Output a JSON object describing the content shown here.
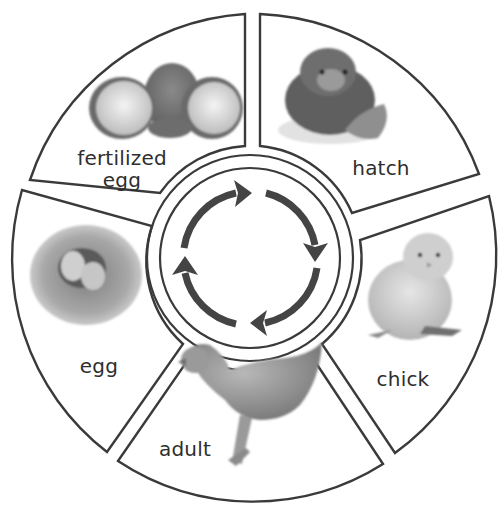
{
  "diagram": {
    "type": "life-cycle",
    "stages": [
      {
        "id": "fertilized-egg",
        "label_line1": "fertilized",
        "label_line2": "egg",
        "image": "cracked-eggshell-photo"
      },
      {
        "id": "hatch",
        "label": "hatch",
        "image": "hatching-chick-photo"
      },
      {
        "id": "chick",
        "label": "chick",
        "image": "chick-photo"
      },
      {
        "id": "adult",
        "label": "adult",
        "image": "hen-photo"
      },
      {
        "id": "egg",
        "label": "egg",
        "image": "nest-with-eggs-photo"
      }
    ],
    "center": {
      "icon": "clockwise-cycle-arrows-icon",
      "arrow_count": 4
    },
    "colors": {
      "outline": "#3a3a3a",
      "arrow": "#444444",
      "text": "#2e2e2e",
      "background": "#ffffff"
    }
  }
}
